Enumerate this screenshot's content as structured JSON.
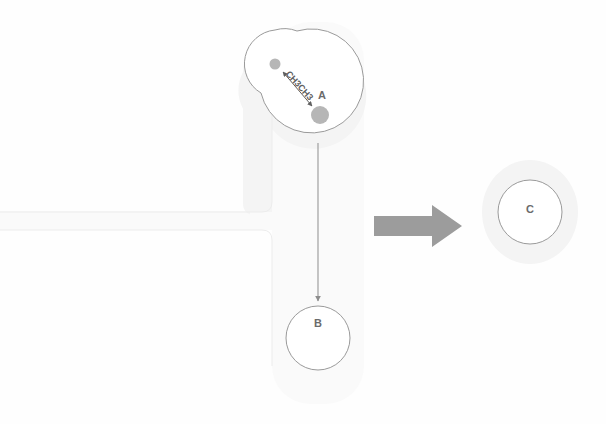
{
  "diagram": {
    "background_color": "#fefefe",
    "halo_color": "#f4f4f4",
    "outline_color": "#9a9a9a",
    "dot_color": "#b6b6b6",
    "arrow_color": "#8d8d8d",
    "block_arrow_color": "#9c9c9c",
    "text_color": "#6b6b6b"
  },
  "nodes": {
    "a": {
      "label": "A",
      "shape": "figure-eight",
      "center_x": 318,
      "center_y": 82
    },
    "b": {
      "label": "B",
      "shape": "circle",
      "center_x": 318,
      "center_y": 338,
      "radius": 32
    },
    "c": {
      "label": "C",
      "shape": "circle",
      "center_x": 530,
      "center_y": 212,
      "radius": 32
    }
  },
  "atoms": {
    "small_dot": {
      "name": "methyl-group-dot-small",
      "center_x": 275,
      "center_y": 64,
      "radius": 5
    },
    "large_dot": {
      "name": "methyl-group-dot-large",
      "center_x": 320,
      "center_y": 115,
      "radius": 9
    }
  },
  "bond": {
    "label": "CH3CH3",
    "type": "double-headed",
    "rotation_deg": 48
  },
  "arrows": {
    "a_to_b": {
      "name": "vertical-transition-arrow",
      "from_x": 318,
      "from_y": 143,
      "to_x": 318,
      "to_y": 303
    },
    "to_c": {
      "name": "block-transform-arrow",
      "direction": "right",
      "from_x": 374,
      "to_x": 462,
      "center_y": 225
    }
  },
  "bands": {
    "vertical": {
      "name": "vertical-channel",
      "x": 272,
      "y": 25,
      "width": 92,
      "height": 378
    },
    "horizontal": {
      "name": "horizontal-channel",
      "x": 0,
      "y": 212,
      "width": 300,
      "height": 18
    }
  }
}
